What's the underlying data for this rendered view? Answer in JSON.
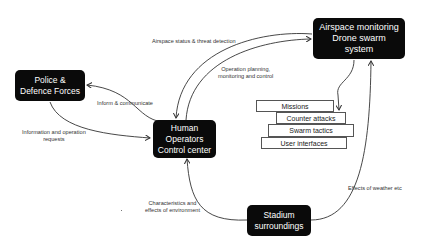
{
  "nodes": {
    "airspace": {
      "lines": [
        "Airspace monitoring",
        "Drone swarm",
        "system"
      ]
    },
    "police": {
      "lines": [
        "Police &",
        "Defence Forces"
      ]
    },
    "human": {
      "lines": [
        "Human",
        "Operators",
        "Control center"
      ]
    },
    "stadium": {
      "lines": [
        "Stadium",
        "surroundings"
      ]
    }
  },
  "stack": {
    "items": [
      "Missions",
      "Counter attacks",
      "Swarm tactics",
      "User interfaces"
    ]
  },
  "edges": {
    "airspace_status": "Airspace status & threat  detection",
    "operation_planning": [
      "Operation planning,",
      "monitoring and control"
    ],
    "inform": "Inform & communicate",
    "info_requests": [
      "Information and operation",
      "requests"
    ],
    "characteristics": [
      "Characteristics and",
      "effects of environment"
    ],
    "weather": "Effects of weather etc"
  },
  "colors": {
    "node_fill": "#0a0a0a",
    "node_text": "#ffffff",
    "edge": "#333333"
  }
}
